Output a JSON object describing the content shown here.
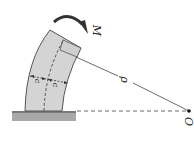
{
  "diagram": {
    "labels": {
      "moment": "M",
      "radius": "ρ",
      "center": "O",
      "c_left": "c",
      "c_right": "c"
    },
    "colors": {
      "beam_fill": "#d4d4d4",
      "beam_stroke": "#555555",
      "ground_fill": "#a8a8a8",
      "line": "#444444",
      "arrow": "#333333"
    }
  }
}
